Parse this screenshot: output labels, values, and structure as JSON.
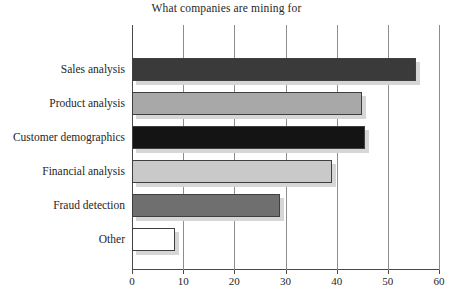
{
  "chart_data": {
    "type": "bar",
    "orientation": "horizontal",
    "title": "What companies are mining for",
    "xlabel": "",
    "ylabel": "",
    "categories": [
      "Sales analysis",
      "Product analysis",
      "Customer demographics",
      "Financial analysis",
      "Fraud detection",
      "Other"
    ],
    "values": [
      55.5,
      45,
      45.5,
      39,
      29,
      8.5
    ],
    "bar_colors": [
      "#3a3a3a",
      "#a8a8a8",
      "#141414",
      "#c9c9c9",
      "#6f6f6f",
      "#ffffff"
    ],
    "bar_edge_color": "#3f3f3f",
    "shadow_color": "#d6d6d6",
    "xlim": [
      0,
      60
    ],
    "xticks": [
      0,
      10,
      20,
      30,
      40,
      50,
      60
    ],
    "xtick_labels": [
      "0",
      "10",
      "20",
      "30",
      "40",
      "50",
      "60"
    ],
    "grid": "vertical",
    "legend": "none",
    "axis_color": "#4a4a4a",
    "gridline_color": "#8d8d8d",
    "background": "#ffffff"
  }
}
